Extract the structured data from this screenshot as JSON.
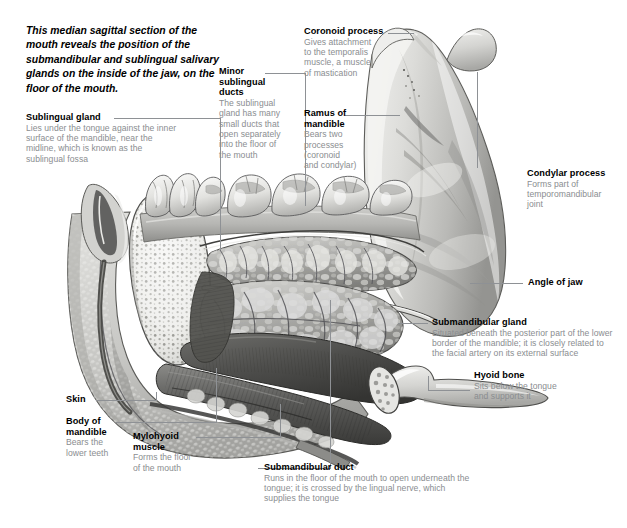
{
  "figure": {
    "intro": "This median sagittal section of the mouth reveals the position of the submandibular and sublingual salivary glands on the inside of the jaw, on the floor of the mouth.",
    "colors": {
      "heading_text": "#000000",
      "body_text": "#8a8d90",
      "leader_line": "#8e9195",
      "background": "#ffffff",
      "bone_light": "#e8e8e6",
      "bone_mid": "#c9c9c6",
      "bone_shadow": "#9a9a97",
      "muscle_dark": "#4a4a48",
      "gland_mid": "#b9b9b6",
      "skin_light": "#d8d8d5"
    }
  },
  "labels": [
    {
      "id": "sublingual-gland",
      "heading": "Sublingual gland",
      "body": "Lies under the tongue against the inner\nsurface of the mandible, near the\nmidline, which is known as the\nsublingual fossa"
    },
    {
      "id": "minor-sublingual-ducts",
      "heading": "Minor\nsublingual\nducts",
      "body": "The sublingual\ngland has many\nsmall ducts that\nopen separately\ninto the floor of\nthe mouth"
    },
    {
      "id": "coronoid-process",
      "heading": "Coronoid process",
      "body": "Gives attachment\nto the temporalis\nmuscle, a muscle\nof mastication"
    },
    {
      "id": "ramus-of-mandible",
      "heading": "Ramus of\nmandible",
      "body": "Bears two\nprocesses\n(coronoid\nand condylar)"
    },
    {
      "id": "condylar-process",
      "heading": "Condylar process",
      "body": "Forms part of\ntemporomandibular\njoint"
    },
    {
      "id": "angle-of-jaw",
      "heading": "Angle of jaw",
      "body": ""
    },
    {
      "id": "submandibular-gland",
      "heading": "Submandibular gland",
      "body": "Situated beneath the posterior part of the lower\nborder of the mandible; it is closely related to\nthe facial artery on its external surface"
    },
    {
      "id": "hyoid-bone",
      "heading": "Hyoid bone",
      "body": "Sits below the tongue\nand supports it"
    },
    {
      "id": "skin",
      "heading": "Skin",
      "body": ""
    },
    {
      "id": "body-of-mandible",
      "heading": "Body of\nmandible",
      "body": "Bears the\nlower teeth"
    },
    {
      "id": "mylohyoid-muscle",
      "heading": "Mylohyoid\nmuscle",
      "body": "Forms the floor\nof the mouth"
    },
    {
      "id": "submandibular-duct",
      "heading": "Submandibular duct",
      "body": "Runs in the floor of the mouth to open underneath the\ntongue; it is crossed by the lingual nerve, which\nsupplies the tongue"
    }
  ]
}
